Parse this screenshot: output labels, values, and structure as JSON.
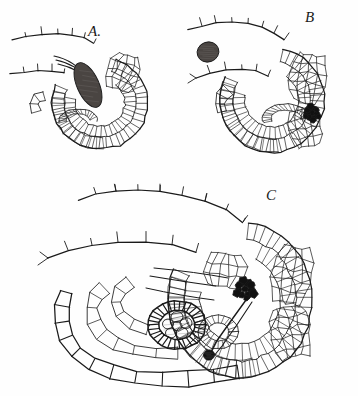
{
  "figure": {
    "kind": "botanical-line-drawing",
    "background_color": "#fefefe",
    "ink_color": "#1a1a1a",
    "shading_color": "#4a4542",
    "dark_fill_color": "#111111",
    "width": 358,
    "height": 396
  },
  "panels": [
    {
      "id": "A",
      "label": "A.",
      "label_x": 88,
      "label_y": 36,
      "center_x": 100,
      "center_y": 95,
      "scale": 1.0,
      "features": [
        "integument-hairs",
        "pollen-tube-strands",
        "dark-nucellus-mass",
        "embryo-sac",
        "cell-wall-network"
      ]
    },
    {
      "id": "B",
      "label": "B",
      "label_x": 305,
      "label_y": 22,
      "center_x": 265,
      "center_y": 88,
      "scale": 1.08,
      "features": [
        "integument-hairs",
        "detached-dark-oval",
        "dark-cell-cluster",
        "embryo-sac",
        "cell-wall-network"
      ]
    },
    {
      "id": "C",
      "label": "C",
      "label_x": 266,
      "label_y": 200,
      "center_x": 180,
      "center_y": 300,
      "scale": 1.45,
      "features": [
        "integument-hairs",
        "long-cell-chain",
        "embryo-sac-ring",
        "dark-cell-cluster",
        "dark-tube-tip",
        "cell-wall-network"
      ]
    }
  ],
  "marks": {
    "panel_a_dark_mass": {
      "name": "dark-stained-nucellus",
      "cx": 88,
      "cy": 85,
      "rx": 11,
      "ry": 24,
      "rotation": -24
    },
    "panel_b_detached_oval": {
      "name": "detached-spore",
      "cx": 208,
      "cy": 52,
      "rx": 11,
      "ry": 10,
      "rotation": -20
    },
    "panel_b_cell_cluster": {
      "name": "dark-cell-cluster",
      "cx": 312,
      "cy": 113,
      "r": 10
    },
    "panel_c_cell_cluster": {
      "name": "dark-cell-cluster",
      "cx": 245,
      "cy": 289,
      "r": 13
    },
    "panel_c_tube_tip": {
      "name": "dark-tube-tip",
      "cx": 209,
      "cy": 355,
      "r": 5.5
    },
    "panel_c_embryo_sac": {
      "name": "embryo-sac-ring",
      "cx": 177,
      "cy": 325,
      "rx": 29,
      "ry": 24
    }
  },
  "render": {
    "stroke_width_outer": 1.25,
    "stroke_width_inner": 0.85,
    "stroke_width_hair": 0.9,
    "seed": 20240517
  }
}
